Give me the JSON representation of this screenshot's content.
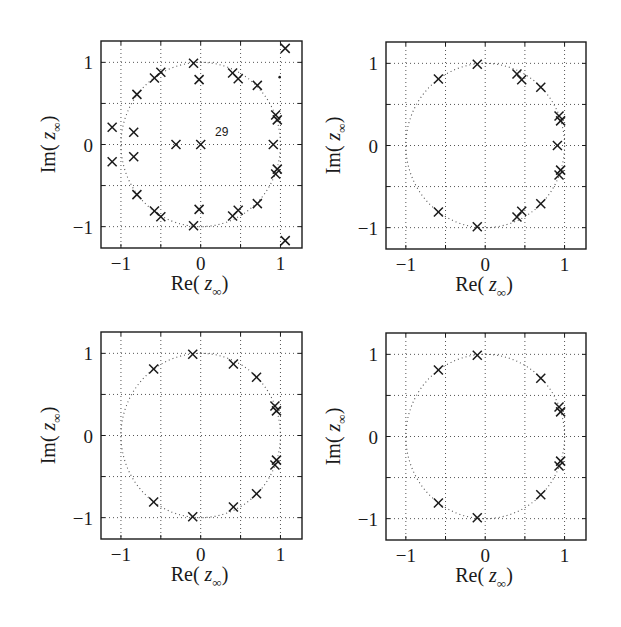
{
  "chart_data": [
    {
      "type": "scatter",
      "panel": "top-left",
      "title": "",
      "xlabel": "Re( z_∞ )",
      "ylabel": "Im( z_∞ )",
      "xlim": [
        -1.25,
        1.27
      ],
      "ylim": [
        -1.26,
        1.26
      ],
      "xticks": [
        -1,
        -0.5,
        0,
        0.5,
        1
      ],
      "xtick_labels": [
        "−1",
        "",
        "0",
        "",
        "1"
      ],
      "yticks": [
        -1,
        -0.5,
        0,
        0.5,
        1
      ],
      "ytick_labels": [
        "−1",
        "",
        "0",
        "",
        "1"
      ],
      "grid": true,
      "unit_circle": true,
      "marker": "x",
      "annotations": [
        {
          "text": "29",
          "x": 0.18,
          "y": 0.1
        }
      ],
      "extra_dots": [
        {
          "x": 0.99,
          "y": 0.82
        }
      ],
      "points": [
        {
          "x": 1.06,
          "y": 1.17
        },
        {
          "x": 1.06,
          "y": -1.17
        },
        {
          "x": -0.09,
          "y": 0.99
        },
        {
          "x": -0.09,
          "y": -0.99
        },
        {
          "x": -0.5,
          "y": 0.88
        },
        {
          "x": -0.5,
          "y": -0.88
        },
        {
          "x": -0.58,
          "y": 0.81
        },
        {
          "x": -0.58,
          "y": -0.81
        },
        {
          "x": 0.4,
          "y": 0.87
        },
        {
          "x": 0.4,
          "y": -0.87
        },
        {
          "x": 0.47,
          "y": 0.8
        },
        {
          "x": 0.47,
          "y": -0.8
        },
        {
          "x": -0.02,
          "y": 0.79
        },
        {
          "x": -0.02,
          "y": -0.79
        },
        {
          "x": 0.71,
          "y": 0.72
        },
        {
          "x": 0.71,
          "y": -0.72
        },
        {
          "x": -0.8,
          "y": 0.61
        },
        {
          "x": -0.8,
          "y": -0.61
        },
        {
          "x": 0.94,
          "y": 0.36
        },
        {
          "x": 0.94,
          "y": -0.36
        },
        {
          "x": 0.96,
          "y": 0.3
        },
        {
          "x": 0.96,
          "y": -0.3
        },
        {
          "x": -1.11,
          "y": 0.21
        },
        {
          "x": -1.11,
          "y": -0.21
        },
        {
          "x": -0.84,
          "y": 0.15
        },
        {
          "x": -0.84,
          "y": -0.15
        },
        {
          "x": -0.31,
          "y": 0.0
        },
        {
          "x": 0.0,
          "y": 0.0
        },
        {
          "x": 0.91,
          "y": 0.0
        }
      ]
    },
    {
      "type": "scatter",
      "panel": "top-right",
      "title": "",
      "xlabel": "Re( z_∞ )",
      "ylabel": "Im( z_∞ )",
      "xlim": [
        -1.25,
        1.27
      ],
      "ylim": [
        -1.26,
        1.26
      ],
      "xticks": [
        -1,
        -0.5,
        0,
        0.5,
        1
      ],
      "xtick_labels": [
        "−1",
        "",
        "0",
        "",
        "1"
      ],
      "yticks": [
        -1,
        -0.5,
        0,
        0.5,
        1
      ],
      "ytick_labels": [
        "−1",
        "",
        "0",
        "",
        "1"
      ],
      "grid": true,
      "unit_circle": true,
      "marker": "x",
      "points": [
        {
          "x": -0.1,
          "y": 0.99
        },
        {
          "x": -0.1,
          "y": -0.99
        },
        {
          "x": -0.59,
          "y": 0.81
        },
        {
          "x": -0.59,
          "y": -0.81
        },
        {
          "x": 0.4,
          "y": 0.87
        },
        {
          "x": 0.4,
          "y": -0.87
        },
        {
          "x": 0.46,
          "y": 0.8
        },
        {
          "x": 0.46,
          "y": -0.8
        },
        {
          "x": 0.7,
          "y": 0.71
        },
        {
          "x": 0.7,
          "y": -0.71
        },
        {
          "x": 0.93,
          "y": 0.36
        },
        {
          "x": 0.93,
          "y": -0.36
        },
        {
          "x": 0.95,
          "y": 0.3
        },
        {
          "x": 0.95,
          "y": -0.3
        },
        {
          "x": 0.91,
          "y": 0.0
        }
      ]
    },
    {
      "type": "scatter",
      "panel": "bottom-left",
      "title": "",
      "xlabel": "Re( z_∞ )",
      "ylabel": "Im( z_∞ )",
      "xlim": [
        -1.25,
        1.27
      ],
      "ylim": [
        -1.26,
        1.26
      ],
      "xticks": [
        -1,
        -0.5,
        0,
        0.5,
        1
      ],
      "xtick_labels": [
        "−1",
        "",
        "0",
        "",
        "1"
      ],
      "yticks": [
        -1,
        -0.5,
        0,
        0.5,
        1
      ],
      "ytick_labels": [
        "−1",
        "",
        "0",
        "",
        "1"
      ],
      "grid": true,
      "unit_circle": true,
      "marker": "x",
      "points": [
        {
          "x": -0.1,
          "y": 0.99
        },
        {
          "x": -0.1,
          "y": -0.99
        },
        {
          "x": -0.59,
          "y": 0.81
        },
        {
          "x": -0.59,
          "y": -0.81
        },
        {
          "x": 0.41,
          "y": 0.87
        },
        {
          "x": 0.41,
          "y": -0.87
        },
        {
          "x": 0.7,
          "y": 0.71
        },
        {
          "x": 0.7,
          "y": -0.71
        },
        {
          "x": 0.93,
          "y": 0.36
        },
        {
          "x": 0.93,
          "y": -0.36
        },
        {
          "x": 0.95,
          "y": 0.3
        },
        {
          "x": 0.95,
          "y": -0.3
        }
      ]
    },
    {
      "type": "scatter",
      "panel": "bottom-right",
      "title": "",
      "xlabel": "Re( z_∞ )",
      "ylabel": "Im( z_∞ )",
      "xlim": [
        -1.25,
        1.27
      ],
      "ylim": [
        -1.26,
        1.26
      ],
      "xticks": [
        -1,
        -0.5,
        0,
        0.5,
        1
      ],
      "xtick_labels": [
        "−1",
        "",
        "0",
        "",
        "1"
      ],
      "yticks": [
        -1,
        -0.5,
        0,
        0.5,
        1
      ],
      "ytick_labels": [
        "−1",
        "",
        "0",
        "",
        "1"
      ],
      "grid": true,
      "unit_circle": true,
      "marker": "x",
      "points": [
        {
          "x": -0.1,
          "y": 0.99
        },
        {
          "x": -0.1,
          "y": -0.99
        },
        {
          "x": -0.59,
          "y": 0.81
        },
        {
          "x": -0.59,
          "y": -0.81
        },
        {
          "x": 0.7,
          "y": 0.71
        },
        {
          "x": 0.7,
          "y": -0.71
        },
        {
          "x": 0.93,
          "y": 0.36
        },
        {
          "x": 0.93,
          "y": -0.36
        },
        {
          "x": 0.95,
          "y": 0.3
        },
        {
          "x": 0.95,
          "y": -0.3
        }
      ]
    }
  ],
  "labels": {
    "xlabel_main": "Re(",
    "xlabel_var": "z",
    "xlabel_sub": "∞",
    "xlabel_close": ")",
    "ylabel_main": "Im(",
    "ylabel_var": "z",
    "ylabel_sub": "∞",
    "ylabel_close": ")"
  },
  "colors": {
    "ink": "#1a1a1a",
    "grid": "#555555",
    "background": "#ffffff"
  }
}
